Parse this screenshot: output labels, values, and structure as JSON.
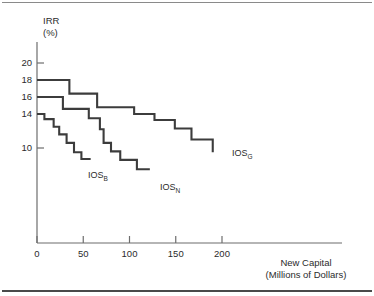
{
  "figure": {
    "background_color": "#ffffff",
    "line_color": "#3c3c3c",
    "axis_color": "#6d6d6d",
    "text_color": "#2b2b2b"
  },
  "axis": {
    "y_title_line1": "IRR",
    "y_title_line2": "(%)",
    "x_title_line1": "New Capital",
    "x_title_line2": "(Millions of Dollars)"
  },
  "labels": {
    "ios_g_base": "IOS",
    "ios_g_sub": "G",
    "ios_n_base": "IOS",
    "ios_n_sub": "N",
    "ios_b_base": "IOS",
    "ios_b_sub": "B"
  },
  "chart_data": {
    "type": "line",
    "title": "",
    "subtitle": "",
    "xlabel": "New Capital (Millions of Dollars)",
    "ylabel": "IRR (%)",
    "xlim": [
      0,
      240
    ],
    "ylim": [
      5.5,
      21
    ],
    "xticks": [
      0,
      50,
      100,
      150,
      200
    ],
    "xticklabels": [
      "0",
      "50",
      "100",
      "150",
      "200"
    ],
    "yticks": [
      20,
      18,
      16,
      14,
      10
    ],
    "yticklabels": [
      "20",
      "18",
      "16",
      "14",
      "10"
    ],
    "grid": false,
    "legend_position": "inline-end-of-line",
    "step_style": "post",
    "annotations": [
      {
        "text": "IOS_G",
        "series": "IOS_G",
        "x": 196,
        "y": 9.5
      },
      {
        "text": "IOS_N",
        "series": "IOS_N",
        "x": 124,
        "y": 7.5
      },
      {
        "text": "IOS_B",
        "series": "IOS_B",
        "x": 60,
        "y": 8.7
      }
    ],
    "series": [
      {
        "name": "IOS_G",
        "label": "IOS G",
        "description": "Optimistic investment opportunity schedule",
        "color": "#3c3c3c",
        "points": [
          {
            "x": 0,
            "y": 18.0
          },
          {
            "x": 35,
            "y": 18.0
          },
          {
            "x": 35,
            "y": 16.4
          },
          {
            "x": 65,
            "y": 16.4
          },
          {
            "x": 65,
            "y": 14.8
          },
          {
            "x": 105,
            "y": 14.8
          },
          {
            "x": 105,
            "y": 14.0
          },
          {
            "x": 127,
            "y": 14.0
          },
          {
            "x": 127,
            "y": 13.3
          },
          {
            "x": 149,
            "y": 13.3
          },
          {
            "x": 149,
            "y": 12.3
          },
          {
            "x": 167,
            "y": 12.3
          },
          {
            "x": 167,
            "y": 11.0
          },
          {
            "x": 190,
            "y": 11.0
          },
          {
            "x": 190,
            "y": 9.5
          }
        ]
      },
      {
        "name": "IOS_N",
        "label": "IOS N",
        "description": "Normal / expected investment opportunity schedule",
        "color": "#3c3c3c",
        "points": [
          {
            "x": 0,
            "y": 16.0
          },
          {
            "x": 28,
            "y": 16.0
          },
          {
            "x": 28,
            "y": 14.6
          },
          {
            "x": 56,
            "y": 14.6
          },
          {
            "x": 56,
            "y": 13.5
          },
          {
            "x": 68,
            "y": 13.5
          },
          {
            "x": 68,
            "y": 12.2
          },
          {
            "x": 72,
            "y": 12.2
          },
          {
            "x": 72,
            "y": 10.6
          },
          {
            "x": 80,
            "y": 10.6
          },
          {
            "x": 80,
            "y": 9.6
          },
          {
            "x": 90,
            "y": 9.6
          },
          {
            "x": 90,
            "y": 8.6
          },
          {
            "x": 108,
            "y": 8.6
          },
          {
            "x": 108,
            "y": 7.5
          },
          {
            "x": 122,
            "y": 7.5
          }
        ]
      },
      {
        "name": "IOS_B",
        "label": "IOS B",
        "description": "Pessimistic investment opportunity schedule",
        "color": "#3c3c3c",
        "points": [
          {
            "x": 0,
            "y": 14.0
          },
          {
            "x": 8,
            "y": 14.0
          },
          {
            "x": 8,
            "y": 13.4
          },
          {
            "x": 18,
            "y": 13.4
          },
          {
            "x": 18,
            "y": 12.5
          },
          {
            "x": 24,
            "y": 12.5
          },
          {
            "x": 24,
            "y": 11.6
          },
          {
            "x": 32,
            "y": 11.6
          },
          {
            "x": 32,
            "y": 10.6
          },
          {
            "x": 40,
            "y": 10.6
          },
          {
            "x": 40,
            "y": 9.5
          },
          {
            "x": 48,
            "y": 9.5
          },
          {
            "x": 48,
            "y": 8.7
          },
          {
            "x": 58,
            "y": 8.7
          }
        ]
      }
    ]
  }
}
